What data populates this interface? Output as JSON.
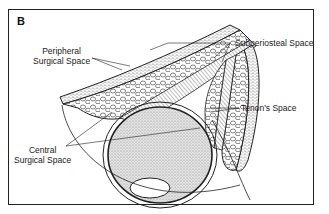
{
  "figure": {
    "panel_letter": "B",
    "labels": {
      "peripheral_line1": "Peripheral",
      "peripheral_line2": "Surgical Space",
      "subperiosteal": "Subperiosteal Space",
      "tenons": "Tenon's Space",
      "central_line1": "Central",
      "central_line2": "Surgical Space"
    },
    "colors": {
      "line": "#222222",
      "fat_fill": "#ffffff",
      "globe_fill": "#cfcfcf",
      "frame": "#222222"
    }
  }
}
